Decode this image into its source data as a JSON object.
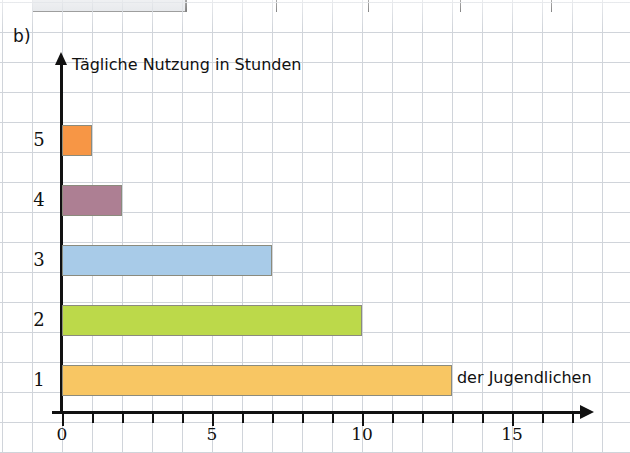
{
  "figure": {
    "label": "b)"
  },
  "previous_figure_fragment": {
    "description": "cropped-grey-bar",
    "tick_positions_px": [
      185,
      276,
      368,
      460,
      551
    ]
  },
  "chart_data": {
    "type": "bar",
    "orientation": "horizontal",
    "title": "",
    "xlabel": "Anzahl der Jugendlichen",
    "ylabel": "Tägliche Nutzung in Stunden",
    "categories": [
      "1",
      "2",
      "3",
      "4",
      "5"
    ],
    "values": [
      13,
      10,
      7,
      2,
      1
    ],
    "bar_colors": [
      "#f8c663",
      "#bcd94a",
      "#a8cbe8",
      "#ad7f93",
      "#f79645"
    ],
    "xlim": [
      0,
      17
    ],
    "ylim": [
      0,
      5
    ],
    "xticks": [
      0,
      1,
      2,
      3,
      4,
      5,
      6,
      7,
      8,
      9,
      10,
      11,
      12,
      13,
      14,
      15,
      16,
      17
    ],
    "xtick_labels": [
      {
        "value": 0,
        "label": "0"
      },
      {
        "value": 5,
        "label": "5"
      },
      {
        "value": 10,
        "label": "10"
      },
      {
        "value": 15,
        "label": "15"
      }
    ],
    "grid": true,
    "grid_color": "#c8cdd4",
    "grid_spacing_units": 1,
    "legend": null,
    "series": [
      {
        "name": "Anzahl der Jugendlichen",
        "points": [
          {
            "category": "1",
            "value": 13,
            "color": "#f8c663"
          },
          {
            "category": "2",
            "value": 10,
            "color": "#bcd94a"
          },
          {
            "category": "3",
            "value": 7,
            "color": "#a8cbe8"
          },
          {
            "category": "4",
            "value": 2,
            "color": "#ad7f93"
          },
          {
            "category": "5",
            "value": 1,
            "color": "#f79645"
          }
        ]
      }
    ]
  }
}
